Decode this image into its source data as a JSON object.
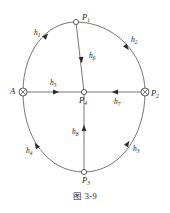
{
  "figure": {
    "caption": "图 3-9",
    "nodes": [
      {
        "id": "P1",
        "label": "P",
        "sub": "1",
        "marker": "open-circle",
        "x": 76,
        "y": 22,
        "label_dx": 6,
        "label_dy": -2
      },
      {
        "id": "A",
        "label": "A",
        "sub": "",
        "marker": "crossed-circle",
        "x": 23,
        "y": 92,
        "label_dx": -13,
        "label_dy": 2
      },
      {
        "id": "P2",
        "label": "P",
        "sub": "2",
        "marker": "crossed-circle",
        "x": 145,
        "y": 92,
        "label_dx": 6,
        "label_dy": 4
      },
      {
        "id": "P3",
        "label": "P",
        "sub": "3",
        "marker": "open-circle",
        "x": 84,
        "y": 172,
        "label_dx": 2,
        "label_dy": 10
      },
      {
        "id": "P4",
        "label": "P",
        "sub": "4",
        "marker": "open-circle",
        "x": 84,
        "y": 92,
        "label_dx": 0,
        "label_dy": 11
      }
    ],
    "edges": [
      {
        "id": "h1",
        "label": "h",
        "sub": "1",
        "from": "A",
        "to": "P1",
        "kind": "arc-upper-left",
        "label_x": 36,
        "label_y": 35
      },
      {
        "id": "h2",
        "label": "h",
        "sub": "2",
        "from": "P1",
        "to": "P2",
        "kind": "arc-upper-right",
        "label_x": 133,
        "label_y": 42
      },
      {
        "id": "h3",
        "label": "h",
        "sub": "3",
        "from": "P3",
        "to": "P2",
        "kind": "arc-lower-right",
        "label_x": 134,
        "label_y": 150
      },
      {
        "id": "h4",
        "label": "h",
        "sub": "4",
        "from": "P3",
        "to": "A",
        "kind": "arc-lower-left",
        "label_x": 29,
        "label_y": 153
      },
      {
        "id": "h5",
        "label": "h",
        "sub": "5",
        "from": "A",
        "to": "P4",
        "kind": "chord-left",
        "label_x": 52,
        "label_y": 84
      },
      {
        "id": "h6",
        "label": "h",
        "sub": "6",
        "from": "P1",
        "to": "P4",
        "kind": "chord-top",
        "label_x": 92,
        "label_y": 56
      },
      {
        "id": "h7",
        "label": "h",
        "sub": "7",
        "from": "P2",
        "to": "P4",
        "kind": "chord-right",
        "label_x": 117,
        "label_y": 103
      },
      {
        "id": "h8",
        "label": "h",
        "sub": "8",
        "from": "P3",
        "to": "P4",
        "kind": "chord-bottom",
        "label_x": 76,
        "label_y": 133
      }
    ]
  }
}
